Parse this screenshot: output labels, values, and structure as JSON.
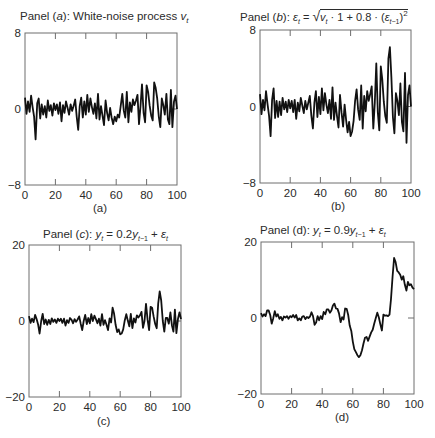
{
  "figure": {
    "panels": [
      {
        "id": "a",
        "title_prefix": "Panel (",
        "title_letter": "a",
        "title_suffix": "): White-noise process ",
        "title_var": "v",
        "title_sub": "t",
        "caption": "(a)"
      },
      {
        "id": "b",
        "title_prefix": "Panel (",
        "title_letter": "b",
        "title_suffix": "): ",
        "title_formula": "ε_t = √(v_t · 1 + 0.8 · (ε_{t-1})²)",
        "caption": "(b)"
      },
      {
        "id": "c",
        "title_prefix": "Panel (",
        "title_letter": "c",
        "title_suffix": "): ",
        "title_formula": "y_t = 0.2y_{t-1} + ε_t",
        "caption": "(c)"
      },
      {
        "id": "d",
        "title_prefix": "Panel (d): ",
        "title_formula": "y_t = 0.9y_{t-1} + ε_t",
        "caption": "(d)"
      }
    ]
  },
  "chart_data": [
    {
      "type": "line",
      "title": "Panel (a): White-noise process v_t",
      "caption": "(a)",
      "xlabel": "",
      "ylabel": "",
      "xlim": [
        0,
        100
      ],
      "ylim": [
        -8,
        8
      ],
      "xticks": [
        0,
        20,
        40,
        60,
        80,
        100
      ],
      "yticks": [
        -8,
        0,
        8
      ],
      "ytick_labels": [
        "−8",
        "0",
        "8"
      ],
      "grid": false,
      "series": [
        {
          "name": "v_t",
          "values": [
            1.2,
            -0.5,
            0.8,
            -0.3,
            1.4,
            0.2,
            -0.8,
            -3.2,
            0.6,
            1.1,
            -1.0,
            0.5,
            -0.6,
            0.3,
            -0.9,
            0.9,
            -0.2,
            0.4,
            -0.7,
            0.6,
            -0.1,
            0.5,
            -0.5,
            0.7,
            -1.3,
            0.4,
            -0.4,
            0.8,
            0.1,
            -0.6,
            0.5,
            -0.2,
            0.3,
            1.0,
            -0.8,
            -2.2,
            0.3,
            1.2,
            -0.9,
            0.8,
            -0.6,
            1.5,
            -0.3,
            1.1,
            0.2,
            -0.5,
            0.6,
            -1.0,
            1.6,
            -1.1,
            0.3,
            -0.7,
            -1.7,
            0.9,
            -0.4,
            -1.2,
            0.1,
            -0.9,
            -1.6,
            -0.8,
            -1.3,
            -0.6,
            -0.9,
            0.4,
            1.6,
            -0.2,
            -0.9,
            1.8,
            -1.4,
            0.7,
            -0.3,
            1.0,
            0.4,
            0.9,
            1.5,
            -1.6,
            0.3,
            2.6,
            -0.4,
            -1.4,
            2.5,
            1.8,
            0.4,
            -0.7,
            -1.2,
            2.8,
            2.2,
            1.1,
            -0.8,
            -1.9,
            1.1,
            0.4,
            -0.6,
            1.6,
            -1.1,
            -1.6,
            2.0,
            -1.9,
            0.8,
            1.4,
            0.0
          ]
        }
      ]
    },
    {
      "type": "line",
      "title": "Panel (b): ε_t = √(v_t · 1 + 0.8 · (ε_{t-1})²)",
      "caption": "(b)",
      "xlabel": "",
      "ylabel": "",
      "xlim": [
        0,
        100
      ],
      "ylim": [
        -8,
        8
      ],
      "xticks": [
        0,
        20,
        40,
        60,
        80,
        100
      ],
      "yticks": [
        -8,
        0,
        8
      ],
      "ytick_labels": [
        "−8",
        "0",
        "8"
      ],
      "grid": false,
      "series": [
        {
          "name": "ε_t",
          "values": [
            1.3,
            -0.8,
            0.7,
            -0.4,
            1.6,
            0.2,
            -1.0,
            -3.1,
            0.7,
            1.9,
            -1.2,
            0.6,
            -1.1,
            0.5,
            -0.9,
            0.9,
            -0.3,
            0.5,
            -0.6,
            0.7,
            -0.2,
            0.6,
            -0.6,
            0.7,
            -1.3,
            0.4,
            -0.5,
            0.9,
            0.1,
            -0.7,
            0.6,
            -0.3,
            0.4,
            1.1,
            -0.9,
            -2.3,
            0.4,
            1.6,
            -1.1,
            1.0,
            -0.8,
            1.9,
            -0.4,
            1.4,
            0.2,
            -0.7,
            0.7,
            -1.3,
            2.0,
            -1.4,
            0.4,
            -1.0,
            -2.2,
            1.2,
            -0.6,
            -2.1,
            0.2,
            -1.4,
            -2.7,
            -1.6,
            -3.1,
            -2.6,
            -1.5,
            0.6,
            1.8,
            -0.3,
            -1.4,
            2.2,
            -2.3,
            1.1,
            -0.5,
            1.6,
            0.6,
            1.3,
            2.1,
            -2.3,
            0.4,
            4.5,
            -0.6,
            -2.5,
            4.2,
            2.8,
            0.5,
            -1.0,
            -1.7,
            5.0,
            6.2,
            3.0,
            -1.1,
            -2.8,
            1.4,
            0.6,
            -0.9,
            2.4,
            -1.6,
            -2.6,
            3.5,
            -3.8,
            1.2,
            2.2,
            0.0
          ]
        }
      ]
    },
    {
      "type": "line",
      "title": "Panel (c): y_t = 0.2y_{t-1} + ε_t",
      "caption": "(c)",
      "xlabel": "",
      "ylabel": "",
      "xlim": [
        0,
        100
      ],
      "ylim": [
        -20,
        20
      ],
      "xticks": [
        0,
        20,
        40,
        60,
        80,
        100
      ],
      "yticks": [
        -20,
        0,
        20
      ],
      "ytick_labels": [
        "−20",
        "0",
        "20"
      ],
      "grid": false,
      "series": [
        {
          "name": "y_t",
          "values": [
            1.3,
            -0.5,
            0.6,
            -0.3,
            1.6,
            0.5,
            -0.9,
            -3.3,
            0.0,
            1.9,
            -0.8,
            0.4,
            -1.0,
            0.3,
            -0.8,
            0.7,
            -0.2,
            0.4,
            -0.5,
            0.6,
            0.0,
            0.6,
            -0.5,
            0.6,
            -1.2,
            0.2,
            -0.5,
            0.8,
            0.3,
            -0.6,
            0.5,
            -0.2,
            0.4,
            1.2,
            -0.7,
            -2.4,
            0.0,
            1.6,
            -0.8,
            0.8,
            -0.6,
            1.8,
            0.0,
            1.4,
            0.5,
            -0.6,
            0.6,
            -1.2,
            1.8,
            -1.0,
            0.2,
            -1.0,
            -2.4,
            0.7,
            -0.4,
            3.5,
            1.9,
            -1.0,
            -2.9,
            -2.2,
            -3.5,
            -3.3,
            -2.2,
            0.2,
            1.8,
            0.1,
            -1.4,
            1.9,
            -1.9,
            0.7,
            -0.4,
            1.5,
            0.9,
            1.5,
            2.4,
            -1.8,
            0.0,
            4.5,
            0.3,
            -2.4,
            3.7,
            3.5,
            1.2,
            -0.8,
            -1.9,
            4.6,
            7.8,
            5.4,
            0.0,
            -2.8,
            0.8,
            0.8,
            -0.7,
            2.3,
            -1.1,
            -2.8,
            3.0,
            -3.2,
            0.6,
            2.3,
            0.5
          ]
        }
      ]
    },
    {
      "type": "line",
      "title": "Panel (d): y_t = 0.9y_{t-1} + ε_t",
      "caption": "(d)",
      "xlabel": "",
      "ylabel": "",
      "xlim": [
        0,
        100
      ],
      "ylim": [
        -20,
        20
      ],
      "xticks": [
        0,
        20,
        40,
        60,
        80,
        100
      ],
      "yticks": [
        -20,
        0,
        20
      ],
      "ytick_labels": [
        "−20",
        "0",
        "20"
      ],
      "grid": false,
      "series": [
        {
          "name": "y_t",
          "values": [
            1.3,
            0.4,
            1.0,
            0.5,
            2.0,
            2.0,
            0.8,
            -1.5,
            -0.1,
            1.8,
            0.4,
            1.0,
            -0.2,
            0.3,
            -0.6,
            0.4,
            0.1,
            0.5,
            -0.2,
            0.5,
            0.2,
            0.8,
            0.1,
            0.8,
            -0.6,
            -0.1,
            -0.6,
            0.4,
            0.5,
            -0.3,
            0.3,
            0.0,
            0.4,
            1.5,
            0.5,
            -1.8,
            -1.2,
            0.5,
            -0.6,
            0.5,
            -0.3,
            1.6,
            1.0,
            2.3,
            2.3,
            1.4,
            2.0,
            3.3,
            3.8,
            2.5,
            2.4,
            1.2,
            -1.1,
            0.2,
            -0.4,
            2.5,
            2.4,
            0.8,
            -2.0,
            -3.4,
            -6.2,
            -8.2,
            -9.0,
            -9.8,
            -10.3,
            -9.8,
            -8.5,
            -6.7,
            -5.2,
            -5.0,
            -6.0,
            -4.9,
            -3.8,
            -3.1,
            -1.5,
            0.0,
            1.4,
            0.2,
            -1.6,
            -3.3,
            0.9,
            0.6,
            0.7,
            0.5,
            0.9,
            5.0,
            11.0,
            15.8,
            14.7,
            12.4,
            12.0,
            11.4,
            10.1,
            11.0,
            8.8,
            7.2,
            9.5,
            8.6,
            8.9,
            8.0,
            7.6
          ]
        }
      ]
    }
  ]
}
